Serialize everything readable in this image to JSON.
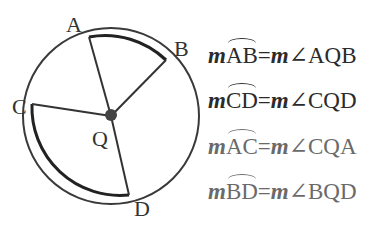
{
  "diagram": {
    "center_label": "Q",
    "points": {
      "A": "A",
      "B": "B",
      "C": "C",
      "D": "D"
    },
    "colors": {
      "line": "#333333",
      "dark_text": "#2b2b2b",
      "grey_text": "#6a6a6a"
    }
  },
  "equations": [
    {
      "m1": "m",
      "arc": "AB",
      "eq": "=",
      "m2": "m",
      "angle": "∠AQB"
    },
    {
      "m1": "m",
      "arc": "CD",
      "eq": "=",
      "m2": "m",
      "angle": "∠CQD"
    },
    {
      "m1": "m",
      "arc": "AC",
      "eq": "=",
      "m2": "m",
      "angle": "∠CQA"
    },
    {
      "m1": "m",
      "arc": "BD",
      "eq": "=",
      "m2": "m",
      "angle": "∠BQD"
    }
  ]
}
